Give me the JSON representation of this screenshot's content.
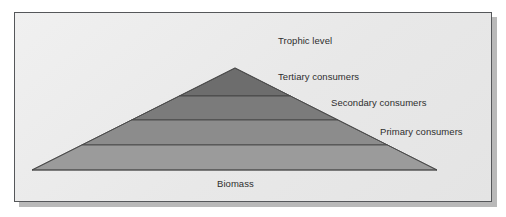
{
  "figure": {
    "frame": {
      "background_color": "#ececec",
      "border_color": "#55575a",
      "shadow_color": "#b9b9b9"
    }
  },
  "chart_data": {
    "type": "pyramid",
    "title": "",
    "xlabel": "Biomass",
    "ylabel": "Trophic level",
    "axis_labels": {
      "vertical": "Trophic level",
      "horizontal": "Biomass"
    },
    "grid": false,
    "legend_position": "inline-right",
    "categories": [
      "Tertiary consumers",
      "Secondary consumers",
      "Primary consumers",
      "Producers"
    ],
    "levels": [
      {
        "rank": 4,
        "label": "Tertiary consumers",
        "color": "#6d6d6d",
        "relative_biomass": 0.1,
        "band_top_y": 68,
        "band_bottom_y": 96
      },
      {
        "rank": 3,
        "label": "Secondary consumers",
        "color": "#7b7b7b",
        "relative_biomass": 0.3,
        "band_top_y": 96,
        "band_bottom_y": 120
      },
      {
        "rank": 2,
        "label": "Primary consumers",
        "color": "#8c8c8c",
        "relative_biomass": 0.62,
        "band_top_y": 120,
        "band_bottom_y": 145
      },
      {
        "rank": 1,
        "label": "Producers",
        "color": "#9b9b9b",
        "relative_biomass": 1.0,
        "band_top_y": 145,
        "band_bottom_y": 170
      }
    ],
    "geometry": {
      "apex_x": 235,
      "apex_y": 68,
      "base_left_x": 32,
      "base_right_x": 437,
      "base_y": 170,
      "divider_color": "#3f3f3f"
    }
  },
  "labels": {
    "trophic_level": "Trophic level",
    "tertiary": "Tertiary consumers",
    "secondary": "Secondary consumers",
    "primary": "Primary consumers",
    "biomass": "Biomass"
  }
}
